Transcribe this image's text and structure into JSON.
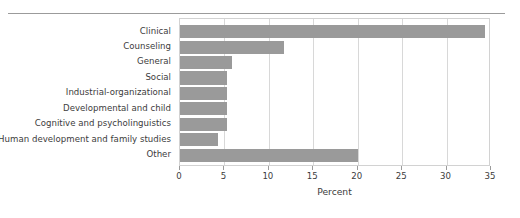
{
  "chart_data": {
    "type": "bar",
    "orientation": "horizontal",
    "title": "",
    "xlabel": "Percent",
    "ylabel": "",
    "xlim": [
      0,
      35
    ],
    "ylim": null,
    "grid": true,
    "legend": null,
    "bar_color": "#9a9a9a",
    "xticks": [
      0,
      5,
      10,
      15,
      20,
      25,
      30,
      35
    ],
    "xtick_labels": [
      "0",
      "5",
      "10",
      "15",
      "20",
      "25",
      "30",
      "35"
    ],
    "categories": [
      "Clinical",
      "Counseling",
      "General",
      "Social",
      "Industrial-organizational",
      "Developmental and child",
      "Cognitive and psycholinguistics",
      "Human development and family studies",
      "Other"
    ],
    "values": [
      34.3,
      11.7,
      5.8,
      5.3,
      5.3,
      5.3,
      5.3,
      4.3,
      20.0
    ]
  },
  "axis": {
    "x_title": "Percent"
  }
}
